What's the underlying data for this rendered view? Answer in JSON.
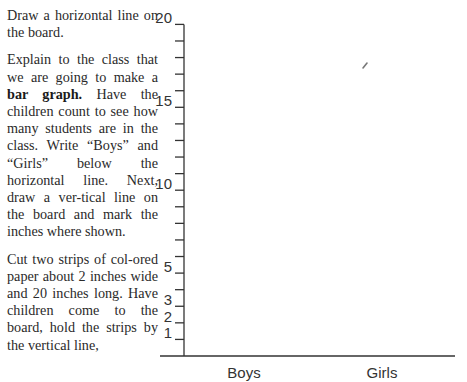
{
  "instructions": {
    "paragraphs": [
      {
        "parts": [
          {
            "text": "Draw a horizontal line on the board.",
            "bold": false
          }
        ]
      },
      {
        "parts": [
          {
            "text": "Explain to the class that we are going to make a ",
            "bold": false
          },
          {
            "text": "bar graph.",
            "bold": true
          },
          {
            "text": " Have the children count to see how many students are in the class. Write “Boys” and “Girls” below the horizontal line. Next, draw a ver-tical line on the board and mark the inches where shown.",
            "bold": false
          }
        ]
      },
      {
        "parts": [
          {
            "text": "Cut two strips of col-ored paper about 2 inches wide and 20 inches long. Have children come to the board, hold the strips by the vertical line,",
            "bold": false
          }
        ]
      }
    ]
  },
  "chart_data": {
    "type": "bar",
    "title": "",
    "xlabel": "",
    "ylabel": "",
    "categories": [
      "Boys",
      "Girls"
    ],
    "values": [
      null,
      null
    ],
    "ylim": [
      0,
      20
    ],
    "y_ticks": [
      1,
      2,
      3,
      4,
      5,
      6,
      7,
      8,
      9,
      10,
      11,
      12,
      13,
      14,
      15,
      16,
      17,
      18,
      19,
      20
    ],
    "y_tick_labels": [
      {
        "value": 1,
        "label": "1"
      },
      {
        "value": 2,
        "label": "2"
      },
      {
        "value": 3,
        "label": "3"
      },
      {
        "value": 5,
        "label": "5"
      },
      {
        "value": 10,
        "label": "10"
      },
      {
        "value": 15,
        "label": "15"
      },
      {
        "value": 20,
        "label": "20"
      }
    ],
    "grid": false,
    "legend": "none",
    "unit": "inches"
  }
}
